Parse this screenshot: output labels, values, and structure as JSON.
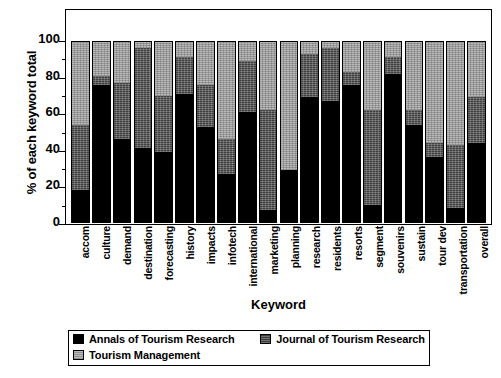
{
  "chart_data": {
    "type": "bar",
    "stacked": true,
    "title": "",
    "xlabel": "Keyword",
    "ylabel": "% of each keyword total",
    "ylim": [
      0,
      100
    ],
    "yticks": [
      100,
      80,
      60,
      40,
      20,
      0
    ],
    "grid": false,
    "legend_position": "bottom",
    "categories": [
      "accom",
      "culture",
      "demand",
      "destination",
      "forecasting",
      "history",
      "impacts",
      "infotech",
      "international",
      "marketing",
      "planning",
      "research",
      "residents",
      "resorts",
      "segment",
      "souvenirs",
      "sustain",
      "tour dev",
      "transportation",
      "overall"
    ],
    "series": [
      {
        "name": "Annals of Tourism Research",
        "color": "#000000",
        "values": [
          18,
          76,
          46,
          41,
          39,
          71,
          53,
          27,
          61,
          7,
          29,
          69,
          67,
          76,
          10,
          82,
          54,
          36,
          8,
          44
        ]
      },
      {
        "name": "Journal of Tourism Research",
        "color": "#3f3f3f",
        "values": [
          36,
          5,
          31,
          55,
          31,
          20,
          23,
          19,
          28,
          55,
          0,
          24,
          29,
          7,
          52,
          9,
          8,
          8,
          35,
          25
        ]
      },
      {
        "name": "Tourism Management",
        "color": "#b9b9b9",
        "values": [
          46,
          19,
          23,
          4,
          30,
          9,
          24,
          54,
          11,
          38,
          71,
          7,
          4,
          17,
          38,
          9,
          38,
          56,
          57,
          31
        ]
      }
    ]
  },
  "legend": {
    "items": [
      "Annals of Tourism Research",
      "Journal of Tourism Research",
      "Tourism Management"
    ]
  }
}
